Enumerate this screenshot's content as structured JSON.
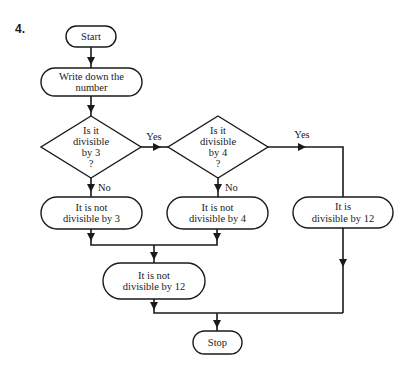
{
  "question_number": "4.",
  "colors": {
    "ink": "#1a1a1a",
    "background": "#ffffff"
  },
  "nodes": [
    {
      "id": "start",
      "type": "terminal",
      "lines": [
        "Start"
      ],
      "x": 66,
      "y": 26,
      "w": 50,
      "h": 21
    },
    {
      "id": "write",
      "type": "process",
      "lines": [
        "Write down the",
        "number"
      ],
      "x": 41,
      "y": 68,
      "w": 101,
      "h": 28
    },
    {
      "id": "div3",
      "type": "decision",
      "lines": [
        "Is it",
        "divisible",
        "by 3",
        "?"
      ],
      "cx": 91,
      "cy": 147,
      "hw": 50,
      "hh": 31
    },
    {
      "id": "div4",
      "type": "decision",
      "lines": [
        "Is it",
        "divisible",
        "by 4",
        "?"
      ],
      "cx": 218,
      "cy": 147,
      "hw": 50,
      "hh": 31
    },
    {
      "id": "notdiv3",
      "type": "process",
      "lines": [
        "It is not",
        "divisible by 3"
      ],
      "x": 41,
      "y": 197,
      "w": 101,
      "h": 32
    },
    {
      "id": "notdiv4",
      "type": "process",
      "lines": [
        "It is not",
        "divisible by 4"
      ],
      "x": 167,
      "y": 197,
      "w": 101,
      "h": 32
    },
    {
      "id": "div12",
      "type": "process",
      "lines": [
        "It is",
        "divisible by 12"
      ],
      "x": 293,
      "y": 197,
      "w": 100,
      "h": 31
    },
    {
      "id": "notdiv12",
      "type": "process",
      "lines": [
        "It is not",
        "divisible by 12"
      ],
      "x": 103,
      "y": 263,
      "w": 102,
      "h": 36
    },
    {
      "id": "stop",
      "type": "terminal",
      "lines": [
        "Stop"
      ],
      "x": 193,
      "y": 331,
      "w": 49,
      "h": 23
    }
  ],
  "edges": [
    {
      "from": "start",
      "to": "write",
      "points": [
        [
          91,
          47
        ],
        [
          91,
          68
        ]
      ],
      "arrow_at": [
        91,
        61
      ],
      "label": ""
    },
    {
      "from": "write",
      "to": "div3",
      "points": [
        [
          91,
          96
        ],
        [
          91,
          116
        ]
      ],
      "arrow_at": [
        91,
        109
      ],
      "label": ""
    },
    {
      "from": "div3",
      "to": "div4",
      "points": [
        [
          141,
          147
        ],
        [
          168,
          147
        ]
      ],
      "arrow_at": [
        157,
        147
      ],
      "dir": "right",
      "label": "Yes",
      "label_pos": [
        154,
        140
      ]
    },
    {
      "from": "div4",
      "to": "div12",
      "points": [
        [
          268,
          147
        ],
        [
          343,
          147
        ],
        [
          343,
          197
        ]
      ],
      "arrow_at": [
        302,
        147
      ],
      "dir": "right",
      "label": "Yes",
      "label_pos": [
        302,
        138
      ]
    },
    {
      "from": "div3",
      "to": "notdiv3",
      "points": [
        [
          91,
          178
        ],
        [
          91,
          197
        ]
      ],
      "arrow_at": [
        91,
        188
      ],
      "label": "No",
      "label_pos": [
        98,
        191
      ]
    },
    {
      "from": "div4",
      "to": "notdiv4",
      "points": [
        [
          218,
          178
        ],
        [
          218,
          197
        ]
      ],
      "arrow_at": [
        218,
        188
      ],
      "label": "No",
      "label_pos": [
        225,
        191
      ]
    },
    {
      "from": "notdiv3",
      "to": "merge1",
      "points": [
        [
          91,
          229
        ],
        [
          91,
          245
        ],
        [
          217,
          245
        ],
        [
          217,
          229
        ]
      ],
      "arrow_at": [
        91,
        237
      ],
      "extra_arrow": [
        217,
        237
      ],
      "label": ""
    },
    {
      "from": "merge1",
      "to": "notdiv12",
      "points": [
        [
          154,
          245
        ],
        [
          154,
          263
        ]
      ],
      "arrow_at": [
        154,
        256
      ],
      "label": ""
    },
    {
      "from": "div12",
      "to": "merge2",
      "points": [
        [
          343,
          228
        ],
        [
          343,
          313
        ]
      ],
      "arrow_at": [
        343,
        263
      ],
      "label": ""
    },
    {
      "from": "notdiv12",
      "to": "merge2",
      "points": [
        [
          154,
          299
        ],
        [
          154,
          313
        ],
        [
          343,
          313
        ]
      ],
      "arrow_at": [
        154,
        306
      ],
      "label": ""
    },
    {
      "from": "merge2",
      "to": "stop",
      "points": [
        [
          217,
          313
        ],
        [
          217,
          331
        ]
      ],
      "arrow_at": [
        217,
        324
      ],
      "label": ""
    }
  ]
}
